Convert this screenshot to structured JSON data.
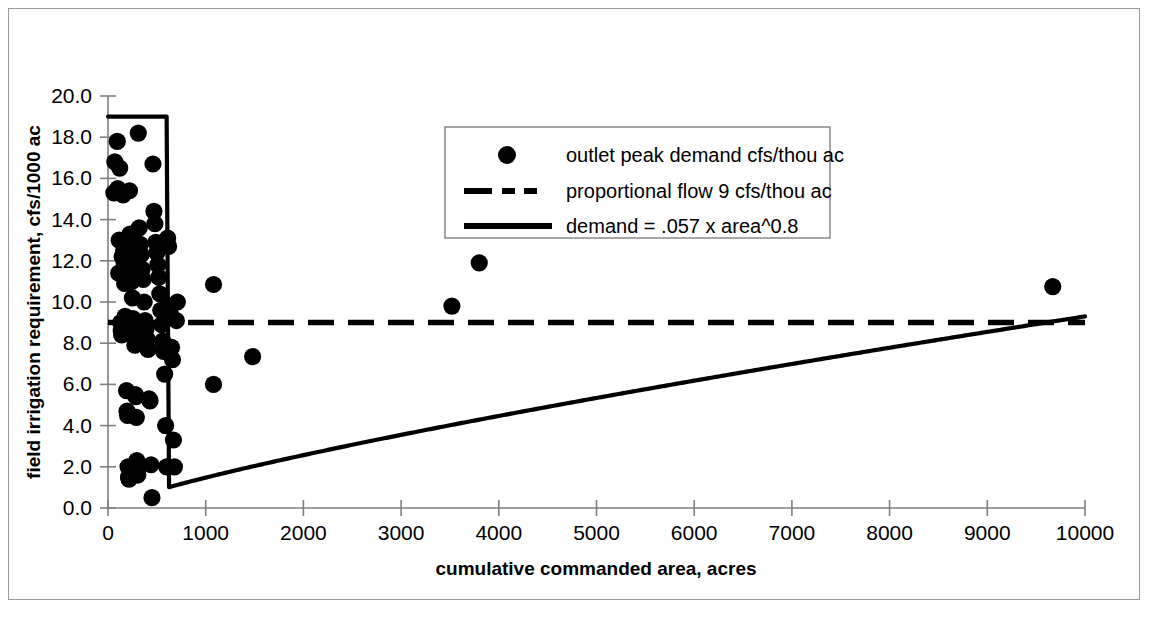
{
  "chart_data": {
    "type": "scatter",
    "title": "",
    "xlabel": "cumulative commanded area, acres",
    "ylabel": "field irrigation requirement, cfs/1000 ac",
    "xlim": [
      0,
      10000
    ],
    "ylim": [
      0.0,
      20.0
    ],
    "xticks": [
      0,
      1000,
      2000,
      3000,
      4000,
      5000,
      6000,
      7000,
      8000,
      9000,
      10000
    ],
    "yticks": [
      0.0,
      2.0,
      4.0,
      6.0,
      8.0,
      10.0,
      12.0,
      14.0,
      16.0,
      18.0,
      20.0
    ],
    "xtick_labels": [
      "0",
      "1000",
      "2000",
      "3000",
      "4000",
      "5000",
      "6000",
      "7000",
      "8000",
      "9000",
      "10000"
    ],
    "ytick_labels": [
      "0.0",
      "2.0",
      "4.0",
      "6.0",
      "8.0",
      "10.0",
      "12.0",
      "14.0",
      "16.0",
      "18.0",
      "20.0"
    ],
    "grid": false,
    "legend_position": "upper-right-inside",
    "marker_color": "#000000",
    "line_color": "#000000",
    "series": [
      {
        "name": "outlet peak demand cfs/thou ac",
        "type": "scatter",
        "marker": "circle",
        "points": [
          [
            60,
            15.3
          ],
          [
            70,
            16.8
          ],
          [
            95,
            17.8
          ],
          [
            100,
            15.5
          ],
          [
            110,
            11.4
          ],
          [
            115,
            13.0
          ],
          [
            120,
            16.5
          ],
          [
            130,
            9.0
          ],
          [
            135,
            8.6
          ],
          [
            140,
            8.4
          ],
          [
            145,
            12.2
          ],
          [
            150,
            15.3
          ],
          [
            155,
            15.2
          ],
          [
            160,
            12.5
          ],
          [
            165,
            11.9
          ],
          [
            170,
            10.9
          ],
          [
            175,
            9.3
          ],
          [
            180,
            8.8
          ],
          [
            185,
            8.5
          ],
          [
            190,
            5.7
          ],
          [
            195,
            4.7
          ],
          [
            200,
            4.5
          ],
          [
            205,
            2.0
          ],
          [
            210,
            1.5
          ],
          [
            215,
            1.4
          ],
          [
            220,
            15.4
          ],
          [
            225,
            13.3
          ],
          [
            230,
            12.6
          ],
          [
            235,
            12.0
          ],
          [
            240,
            11.5
          ],
          [
            245,
            11.0
          ],
          [
            250,
            10.2
          ],
          [
            255,
            9.2
          ],
          [
            260,
            8.9
          ],
          [
            265,
            8.6
          ],
          [
            270,
            8.3
          ],
          [
            275,
            7.9
          ],
          [
            280,
            5.5
          ],
          [
            285,
            5.4
          ],
          [
            290,
            4.4
          ],
          [
            295,
            2.3
          ],
          [
            300,
            1.8
          ],
          [
            305,
            1.6
          ],
          [
            310,
            18.2
          ],
          [
            320,
            13.6
          ],
          [
            330,
            12.8
          ],
          [
            340,
            12.3
          ],
          [
            350,
            11.6
          ],
          [
            360,
            11.1
          ],
          [
            370,
            10.0
          ],
          [
            380,
            9.1
          ],
          [
            390,
            8.7
          ],
          [
            400,
            8.2
          ],
          [
            410,
            7.7
          ],
          [
            420,
            5.3
          ],
          [
            430,
            5.2
          ],
          [
            440,
            2.1
          ],
          [
            450,
            0.5
          ],
          [
            460,
            16.7
          ],
          [
            470,
            14.4
          ],
          [
            480,
            13.8
          ],
          [
            490,
            12.9
          ],
          [
            500,
            12.4
          ],
          [
            510,
            11.8
          ],
          [
            520,
            11.2
          ],
          [
            530,
            10.4
          ],
          [
            540,
            9.6
          ],
          [
            550,
            8.9
          ],
          [
            560,
            8.1
          ],
          [
            570,
            7.6
          ],
          [
            580,
            6.5
          ],
          [
            590,
            4.0
          ],
          [
            600,
            2.0
          ],
          [
            610,
            13.1
          ],
          [
            620,
            12.7
          ],
          [
            630,
            9.8
          ],
          [
            640,
            9.4
          ],
          [
            650,
            7.8
          ],
          [
            660,
            7.2
          ],
          [
            670,
            3.3
          ],
          [
            680,
            2.0
          ],
          [
            700,
            9.1
          ],
          [
            710,
            10.0
          ],
          [
            1080,
            10.85
          ],
          [
            1080,
            6.0
          ],
          [
            1480,
            7.35
          ],
          [
            3520,
            9.8
          ],
          [
            3800,
            11.9
          ],
          [
            9670,
            10.75
          ]
        ]
      },
      {
        "name": "proportional flow  9 cfs/thou ac",
        "type": "line",
        "style": "dashed",
        "constant_value": 9.0
      },
      {
        "name": "demand = .057 x area^0.8",
        "type": "line",
        "style": "solid",
        "equation": "demand = .057 * area^0.8",
        "coefficient": 0.057,
        "exponent": 0.8,
        "cap_value": 19.0,
        "cap_until_x": 600
      }
    ]
  },
  "legend": {
    "entries": [
      {
        "label": "outlet peak demand cfs/thou ac",
        "marker": "circle"
      },
      {
        "label": "proportional flow  9 cfs/thou ac",
        "marker": "dashed-line"
      },
      {
        "label": "demand = .057 x area^0.8",
        "marker": "solid-line"
      }
    ]
  }
}
